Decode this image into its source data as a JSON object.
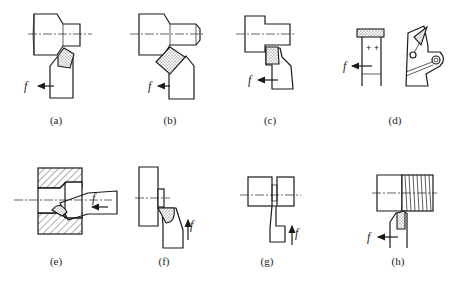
{
  "figure": {
    "type": "technical-drawing",
    "feed_symbol": "f",
    "panels": [
      {
        "id": "a",
        "caption": "(a)",
        "feed_label": "f",
        "feed_direction": "left"
      },
      {
        "id": "b",
        "caption": "(b)",
        "feed_label": "f",
        "feed_direction": "left"
      },
      {
        "id": "c",
        "caption": "(c)",
        "feed_label": "f",
        "feed_direction": "left"
      },
      {
        "id": "d",
        "caption": "(d)",
        "feed_label": "f",
        "feed_direction": "left"
      },
      {
        "id": "e",
        "caption": "(e)",
        "feed_label": "f",
        "feed_direction": "left"
      },
      {
        "id": "f",
        "caption": "(f)",
        "feed_label": "f",
        "feed_direction": "up"
      },
      {
        "id": "g",
        "caption": "(g)",
        "feed_label": "f",
        "feed_direction": "up"
      },
      {
        "id": "h",
        "caption": "(h)",
        "feed_label": "f",
        "feed_direction": "left"
      }
    ]
  }
}
